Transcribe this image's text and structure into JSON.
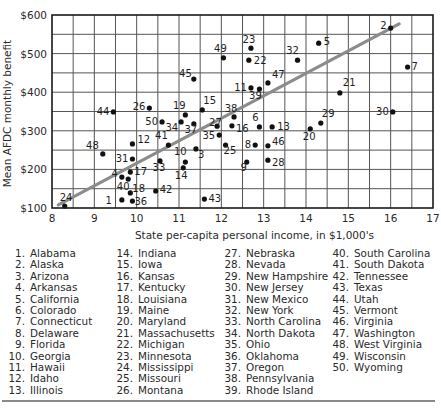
{
  "chart_data": {
    "type": "scatter",
    "title": "",
    "xlabel": "State per-capita personal income, in $1,000's",
    "ylabel": "Mean AFDC monthly benefit",
    "xlim": [
      8,
      17
    ],
    "ylim": [
      100,
      600
    ],
    "x_ticks": [
      8,
      9,
      10,
      11,
      12,
      13,
      14,
      15,
      16,
      17
    ],
    "y_ticks": [
      "$100",
      "$200",
      "$300",
      "$400",
      "$500",
      "$600"
    ],
    "y_tick_values": [
      100,
      200,
      300,
      400,
      500,
      600
    ],
    "grid": true,
    "grid_x_step": 0.5,
    "grid_y_step": 50,
    "regression_line": {
      "x": [
        8.15,
        16.2
      ],
      "y": [
        108,
        577
      ],
      "color": "#8c8c8c"
    },
    "points": [
      {
        "id": 1,
        "state": "Alabama",
        "x": 9.65,
        "y": 121
      },
      {
        "id": 2,
        "state": "Alaska",
        "x": 16.0,
        "y": 566
      },
      {
        "id": 3,
        "state": "Arizona",
        "x": 11.4,
        "y": 253
      },
      {
        "id": 4,
        "state": "Arkansas",
        "x": 9.65,
        "y": 180
      },
      {
        "id": 5,
        "state": "California",
        "x": 14.3,
        "y": 527
      },
      {
        "id": 6,
        "state": "Colorado",
        "x": 12.9,
        "y": 310
      },
      {
        "id": 7,
        "state": "Connecticut",
        "x": 16.4,
        "y": 465
      },
      {
        "id": 8,
        "state": "Delaware",
        "x": 12.8,
        "y": 263
      },
      {
        "id": 9,
        "state": "Florida",
        "x": 12.6,
        "y": 219
      },
      {
        "id": 10,
        "state": "Georgia",
        "x": 11.15,
        "y": 219
      },
      {
        "id": 11,
        "state": "Hawaii",
        "x": 12.7,
        "y": 411
      },
      {
        "id": 12,
        "state": "Idaho",
        "x": 9.9,
        "y": 266
      },
      {
        "id": 13,
        "state": "Illinois",
        "x": 13.2,
        "y": 310
      },
      {
        "id": 14,
        "state": "Indiana",
        "x": 11.1,
        "y": 204
      },
      {
        "id": 15,
        "state": "Iowa",
        "x": 11.55,
        "y": 354
      },
      {
        "id": 16,
        "state": "Kansas",
        "x": 12.25,
        "y": 313
      },
      {
        "id": 17,
        "state": "Kentucky",
        "x": 9.85,
        "y": 193
      },
      {
        "id": 18,
        "state": "Louisiana",
        "x": 9.85,
        "y": 139
      },
      {
        "id": 19,
        "state": "Maine",
        "x": 11.15,
        "y": 341
      },
      {
        "id": 20,
        "state": "Maryland",
        "x": 14.1,
        "y": 305
      },
      {
        "id": 21,
        "state": "Massachusetts",
        "x": 14.8,
        "y": 398
      },
      {
        "id": 22,
        "state": "Michigan",
        "x": 12.65,
        "y": 483
      },
      {
        "id": 23,
        "state": "Minnesota",
        "x": 12.7,
        "y": 514
      },
      {
        "id": 24,
        "state": "Mississippi",
        "x": 8.3,
        "y": 105
      },
      {
        "id": 25,
        "state": "Missouri",
        "x": 12.1,
        "y": 263
      },
      {
        "id": 26,
        "state": "Montana",
        "x": 10.3,
        "y": 359
      },
      {
        "id": 27,
        "state": "Nebraska",
        "x": 11.9,
        "y": 312
      },
      {
        "id": 28,
        "state": "Nevada",
        "x": 13.1,
        "y": 224
      },
      {
        "id": 29,
        "state": "New Hampshire",
        "x": 14.35,
        "y": 320
      },
      {
        "id": 30,
        "state": "New Jersey",
        "x": 16.05,
        "y": 349
      },
      {
        "id": 31,
        "state": "New Mexico",
        "x": 9.9,
        "y": 227
      },
      {
        "id": 32,
        "state": "New York",
        "x": 13.8,
        "y": 483
      },
      {
        "id": 33,
        "state": "North Carolina",
        "x": 10.55,
        "y": 222
      },
      {
        "id": 34,
        "state": "North Dakota",
        "x": 11.05,
        "y": 323
      },
      {
        "id": 35,
        "state": "Ohio",
        "x": 11.95,
        "y": 289
      },
      {
        "id": 36,
        "state": "Oklahoma",
        "x": 9.9,
        "y": 118
      },
      {
        "id": 37,
        "state": "Oregon",
        "x": 11.35,
        "y": 318
      },
      {
        "id": 38,
        "state": "Pennsylvania",
        "x": 12.3,
        "y": 336
      },
      {
        "id": 39,
        "state": "Rhode Island",
        "x": 12.9,
        "y": 408
      },
      {
        "id": 40,
        "state": "South Carolina",
        "x": 9.8,
        "y": 175
      },
      {
        "id": 41,
        "state": "South Dakota",
        "x": 10.75,
        "y": 263
      },
      {
        "id": 42,
        "state": "Tennessee",
        "x": 10.45,
        "y": 144
      },
      {
        "id": 43,
        "state": "Texas",
        "x": 11.6,
        "y": 123
      },
      {
        "id": 44,
        "state": "Utah",
        "x": 9.45,
        "y": 349
      },
      {
        "id": 45,
        "state": "Vermont",
        "x": 11.35,
        "y": 434
      },
      {
        "id": 46,
        "state": "Virginia",
        "x": 13.1,
        "y": 261
      },
      {
        "id": 47,
        "state": "Washington",
        "x": 13.1,
        "y": 424
      },
      {
        "id": 48,
        "state": "West Virginia",
        "x": 9.2,
        "y": 240
      },
      {
        "id": 49,
        "state": "Wisconsin",
        "x": 12.05,
        "y": 489
      },
      {
        "id": 50,
        "state": "Wyoming",
        "x": 10.6,
        "y": 323
      }
    ],
    "legend_position": "bottom"
  },
  "label_offsets": {
    "1": [
      -10,
      4,
      "end"
    ],
    "2": [
      -4,
      1,
      "end"
    ],
    "3": [
      1,
      9,
      "start"
    ],
    "4": [
      -4,
      0,
      "end"
    ],
    "5": [
      4,
      2,
      "start"
    ],
    "6": [
      -4,
      -6,
      "middle"
    ],
    "7": [
      3,
      3,
      "start"
    ],
    "8": [
      -4,
      3,
      "end"
    ],
    "9": [
      -3,
      9,
      "middle"
    ],
    "10": [
      -5,
      -7,
      "middle"
    ],
    "11": [
      -4,
      3,
      "end"
    ],
    "12": [
      4,
      -1,
      "start"
    ],
    "13": [
      4,
      3,
      "start"
    ],
    "14": [
      -2,
      11,
      "middle"
    ],
    "15": [
      0,
      -6,
      "start"
    ],
    "16": [
      3,
      6,
      "start"
    ],
    "17": [
      3,
      3,
      "start"
    ],
    "18": [
      1,
      -1,
      "start"
    ],
    "19": [
      -6,
      -6,
      "middle"
    ],
    "20": [
      -1,
      11,
      "middle"
    ],
    "21": [
      2,
      -7,
      "start"
    ],
    "22": [
      4,
      4,
      "start"
    ],
    "23": [
      -2,
      -5,
      "middle"
    ],
    "24": [
      -6,
      -5,
      "start"
    ],
    "25": [
      -3,
      9,
      "start"
    ],
    "26": [
      -4,
      2,
      "end"
    ],
    "27": [
      -9,
      0,
      "start"
    ],
    "28": [
      3,
      6,
      "start"
    ],
    "29": [
      0,
      -6,
      "start"
    ],
    "30": [
      -4,
      3,
      "end"
    ],
    "31": [
      -4,
      3,
      "end"
    ],
    "32": [
      -5,
      -6,
      "middle"
    ],
    "33": [
      -1,
      10,
      "middle"
    ],
    "34": [
      -3,
      9,
      "end"
    ],
    "35": [
      -4,
      4,
      "end"
    ],
    "36": [
      1,
      4,
      "start"
    ],
    "37": [
      -3,
      9,
      "middle"
    ],
    "38": [
      -3,
      -5,
      "middle"
    ],
    "39": [
      -4,
      10,
      "middle"
    ],
    "40": [
      -5,
      11,
      "middle"
    ],
    "41": [
      -7,
      -6,
      "middle"
    ],
    "42": [
      3,
      2,
      "start"
    ],
    "43": [
      3,
      3,
      "start"
    ],
    "44": [
      -4,
      3,
      "end"
    ],
    "45": [
      -2,
      -2,
      "end"
    ],
    "46": [
      3,
      -1,
      "start"
    ],
    "47": [
      3,
      -5,
      "start"
    ],
    "48": [
      -4,
      -5,
      "end"
    ],
    "49": [
      -3,
      -6,
      "middle"
    ],
    "50": [
      -4,
      3,
      "end"
    ]
  },
  "legend": {
    "columns": [
      [
        "1.|Alabama",
        "2.|Alaska",
        "3.|Arizona",
        "4.|Arkansas",
        "5.|California",
        "6.|Colorado",
        "7.|Connecticut",
        "8.|Delaware",
        "9.|Florida",
        "10.|Georgia",
        "11.|Hawaii",
        "12.|Idaho",
        "13.|Illinois"
      ],
      [
        "14.|Indiana",
        "15.|Iowa",
        "16.|Kansas",
        "17.|Kentucky",
        "18.|Louisiana",
        "19.|Maine",
        "20.|Maryland",
        "21.|Massachusetts",
        "22.|Michigan",
        "23.|Minnesota",
        "24.|Mississippi",
        "25.|Missouri",
        "26.|Montana"
      ],
      [
        "27.|Nebraska",
        "28.|Nevada",
        "29.|New Hampshire",
        "30.|New Jersey",
        "31.|New Mexico",
        "32.|New York",
        "33.|North Carolina",
        "34.|North Dakota",
        "35.|Ohio",
        "36.|Oklahoma",
        "37.|Oregon",
        "38.|Pennsylvania",
        "39.|Rhode Island"
      ],
      [
        "40.|South Carolina",
        "41.|South Dakota",
        "42.|Tennessee",
        "43.|Texas",
        "44.|Utah",
        "45.|Vermont",
        "46.|Virginia",
        "47.|Washington",
        "48.|West Virginia",
        "49.|Wisconsin",
        "50.|Wyoming"
      ]
    ]
  },
  "colors": {
    "grid": "#555555",
    "frame": "#1a1a1a",
    "point": "#111111",
    "regression": "#8c8c8c",
    "text": "#2a2a2a"
  }
}
